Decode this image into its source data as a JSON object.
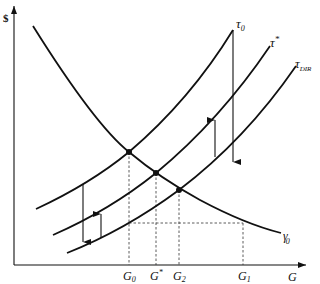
{
  "figure": {
    "y_axis_label": "$",
    "x_axis_label": "G",
    "x_ticks": [
      {
        "id": "G0",
        "base": "G",
        "sub": "0",
        "sup": ""
      },
      {
        "id": "Gstar",
        "base": "G",
        "sub": "",
        "sup": "*"
      },
      {
        "id": "G2",
        "base": "G",
        "sub": "2",
        "sup": ""
      },
      {
        "id": "G1",
        "base": "G",
        "sub": "1",
        "sup": ""
      }
    ],
    "curves": [
      {
        "id": "gamma0",
        "base": "γ",
        "sub": "0",
        "sup": "",
        "shape": "downward-sloping convex"
      },
      {
        "id": "tau0",
        "base": "τ",
        "sub": "0",
        "sup": "",
        "shape": "upward-sloping convex"
      },
      {
        "id": "taustar",
        "base": "τ",
        "sub": "",
        "sup": "*",
        "shape": "upward-sloping convex"
      },
      {
        "id": "taudir",
        "base": "τ",
        "sub": "DIR",
        "sup": "",
        "shape": "upward-sloping convex"
      }
    ],
    "intersections": [
      {
        "curves": [
          "tau0",
          "gamma0"
        ],
        "x_label": "G0"
      },
      {
        "curves": [
          "taustar",
          "gamma0"
        ],
        "x_label": "Gstar"
      },
      {
        "curves": [
          "taudir",
          "gamma0"
        ],
        "x_label": "G2"
      }
    ],
    "guides": [
      {
        "type": "vertical-dashed",
        "at": "G0"
      },
      {
        "type": "vertical-dashed",
        "at": "Gstar"
      },
      {
        "type": "vertical-dashed",
        "at": "G2"
      },
      {
        "type": "vertical-dashed",
        "at": "G1"
      },
      {
        "type": "horizontal-dashed",
        "from": "G0",
        "to": "G1",
        "note": "taudir level at G0 meets gamma0 at G1"
      }
    ],
    "arrows": [
      {
        "direction": "down",
        "from": "tau0",
        "to": "taudir",
        "position": "left"
      },
      {
        "direction": "up",
        "from": "taudir",
        "to": "taustar",
        "position": "left"
      },
      {
        "direction": "up",
        "from": "taudir",
        "to": "taustar",
        "position": "right"
      },
      {
        "direction": "down",
        "from": "tau0",
        "to": "taudir",
        "position": "right"
      }
    ],
    "colors": {
      "line": "#111111",
      "background": "#ffffff"
    }
  }
}
